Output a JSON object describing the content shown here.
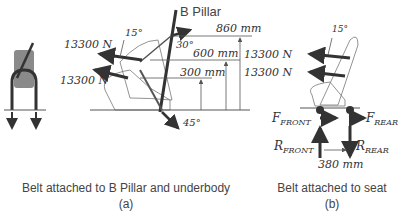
{
  "panel_a": {
    "bpillar_label": "B Pillar",
    "force_upper": "13300 N",
    "force_lower": "13300 N",
    "angle_upper": "15°",
    "angle_pillar": "30°",
    "angle_anchor": "45°",
    "dim_860": "860 mm",
    "dim_600": "600 mm",
    "dim_300": "300 mm",
    "caption": "Belt attached to B Pillar and underbody",
    "sub": "(a)"
  },
  "panel_b": {
    "force_upper": "13300 N",
    "force_lower": "13300 N",
    "angle_upper": "15°",
    "f_front": "F",
    "f_front_sub": "FRONT",
    "f_rear": "F",
    "f_rear_sub": "REAR",
    "r_front": "R",
    "r_front_sub": "FRONT",
    "r_rear": "R",
    "r_rear_sub": "REAR",
    "dim_380": "380 mm",
    "caption": "Belt attached to seat",
    "sub": "(b)"
  },
  "colors": {
    "arrow": "#333333",
    "seat_fill": "#8a8a8a",
    "line": "#555555"
  }
}
